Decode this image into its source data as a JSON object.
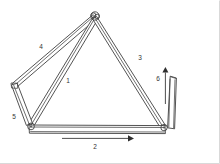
{
  "figure": {
    "background_color": "#ffffff",
    "line_color": "#404040",
    "label_color": "#333333",
    "width": 220,
    "height": 164
  },
  "labels": {
    "member_1": "1",
    "member_2": "2",
    "member_3": "3",
    "member_4": "4",
    "member_5": "5",
    "member_6": "6"
  },
  "members": [
    {
      "id": "member-1",
      "label": "1",
      "label_x": 68,
      "label_y": 81,
      "description": "long diagonal bar from apex joint down-left to lower-left joint",
      "from": [
        95,
        16
      ],
      "to": [
        31,
        126
      ],
      "thickness": 3.6
    },
    {
      "id": "member-2",
      "label": "2",
      "label_x": 95,
      "label_y": 147,
      "description": "horizontal bottom bar spanning lower-left joint to lower-right joint",
      "from": [
        31,
        129
      ],
      "to": [
        163,
        129
      ],
      "thickness": 7.5
    },
    {
      "id": "member-3",
      "label": "3",
      "label_x": 140,
      "label_y": 58,
      "description": "long diagonal bar from apex joint down-right to lower-right joint",
      "from": [
        95,
        16
      ],
      "to": [
        163,
        127
      ],
      "thickness": 3.6
    },
    {
      "id": "member-4",
      "label": "4",
      "label_x": 41,
      "label_y": 47,
      "description": "upper-left diagonal bar from apex joint to far-left joint",
      "from": [
        95,
        16
      ],
      "to": [
        14,
        86
      ],
      "thickness": 3.4
    },
    {
      "id": "member-5",
      "label": "5",
      "label_x": 14,
      "label_y": 117,
      "description": "short left bar from far-left joint down to lower-left joint",
      "from": [
        14,
        86
      ],
      "to": [
        30,
        126
      ],
      "thickness": 4.2
    },
    {
      "id": "member-6",
      "label": "6",
      "label_x": 158,
      "label_y": 79,
      "description": "short vertical bar rising from lower-right joint",
      "from": [
        168,
        128
      ],
      "to": [
        173,
        77
      ],
      "thickness": 5.0
    }
  ],
  "joints": [
    {
      "id": "joint-apex",
      "x": 95,
      "y": 16,
      "r": 4.0
    },
    {
      "id": "joint-left",
      "x": 14,
      "y": 86,
      "r": 2.4
    },
    {
      "id": "joint-lower-left",
      "x": 31,
      "y": 127,
      "r": 3.2
    },
    {
      "id": "joint-lower-right",
      "x": 163,
      "y": 128,
      "r": 3.2
    }
  ],
  "arrows": [
    {
      "id": "arrow-horizontal",
      "name": "arrow-member-2-direction",
      "orientation": "horizontal",
      "label": "2",
      "from": [
        62,
        138
      ],
      "to": [
        131,
        138
      ]
    },
    {
      "id": "arrow-vertical",
      "name": "arrow-member-6-direction",
      "orientation": "vertical",
      "label": "6",
      "from": [
        165,
        104
      ],
      "to": [
        165,
        70
      ]
    }
  ]
}
